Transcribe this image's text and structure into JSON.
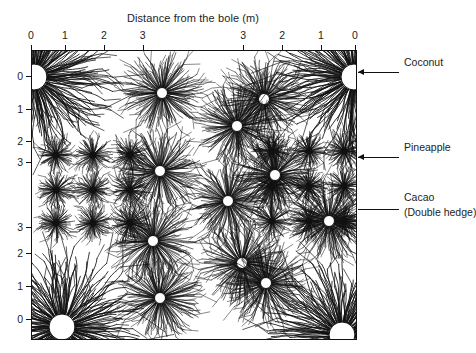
{
  "figure": {
    "axis_title": "Distance from the bole (m)",
    "background_color": "#ffffff",
    "ink_color": "#111111",
    "bole_color": "#ffffff"
  },
  "axes": {
    "x": {
      "label": "Distance from the bole (m)",
      "ticks": [
        {
          "label": "0",
          "pos": 0.0
        },
        {
          "label": "1",
          "pos": 0.105
        },
        {
          "label": "2",
          "pos": 0.225
        },
        {
          "label": "3",
          "pos": 0.345
        },
        {
          "label": "3",
          "pos": 0.655
        },
        {
          "label": "2",
          "pos": 0.775
        },
        {
          "label": "1",
          "pos": 0.895
        },
        {
          "label": "0",
          "pos": 1.0
        }
      ]
    },
    "y": {
      "label": "Distance from the bole (m)",
      "ticks": [
        {
          "label": "0",
          "pos": 0.09
        },
        {
          "label": "1",
          "pos": 0.205
        },
        {
          "label": "2",
          "pos": 0.315
        },
        {
          "label": "3",
          "pos": 0.39
        },
        {
          "label": "3",
          "pos": 0.615
        },
        {
          "label": "2",
          "pos": 0.705
        },
        {
          "label": "1",
          "pos": 0.82
        },
        {
          "label": "0",
          "pos": 0.935
        }
      ]
    }
  },
  "annotations": [
    {
      "id": "coconut",
      "label": "Coconut",
      "sublabel": "",
      "arrow": true,
      "y": 72
    },
    {
      "id": "pineapple",
      "label": "Pineapple",
      "sublabel": "",
      "arrow": true,
      "y": 157
    },
    {
      "id": "cacao",
      "label": "Cacao",
      "sublabel": "(Double hedge)",
      "arrow": false,
      "y": 209
    }
  ],
  "chart_data": {
    "type": "scatter",
    "xlabel": "Distance from the bole (m)",
    "ylabel": "Distance from the bole (m)",
    "xlim": [
      0,
      324
    ],
    "ylim": [
      0,
      288
    ],
    "grid": false,
    "legend": [
      "Coconut",
      "Pineapple",
      "Cacao (Double hedge)"
    ],
    "species": [
      {
        "name": "Coconut",
        "bole_radius": 13,
        "root_radius": 66,
        "root_count": 260,
        "bole_visible": true,
        "plants": [
          {
            "x": 2,
            "y": 26
          },
          {
            "x": 322,
            "y": 26
          },
          {
            "x": 30,
            "y": 276
          },
          {
            "x": 310,
            "y": 284
          }
        ]
      },
      {
        "name": "Cacao",
        "bole_radius": 5.5,
        "root_radius": 36,
        "root_count": 170,
        "bole_visible": true,
        "plants": [
          {
            "x": 130,
            "y": 42
          },
          {
            "x": 232,
            "y": 48
          },
          {
            "x": 205,
            "y": 75
          },
          {
            "x": 128,
            "y": 120
          },
          {
            "x": 243,
            "y": 124
          },
          {
            "x": 196,
            "y": 150
          },
          {
            "x": 121,
            "y": 190
          },
          {
            "x": 210,
            "y": 212
          },
          {
            "x": 128,
            "y": 247
          },
          {
            "x": 234,
            "y": 232
          },
          {
            "x": 297,
            "y": 170
          }
        ]
      },
      {
        "name": "Pineapple",
        "bole_radius": 0,
        "root_radius": 18,
        "root_count": 95,
        "bole_visible": false,
        "plants": [
          {
            "x": 24,
            "y": 104
          },
          {
            "x": 61,
            "y": 104
          },
          {
            "x": 98,
            "y": 104
          },
          {
            "x": 24,
            "y": 139
          },
          {
            "x": 61,
            "y": 139
          },
          {
            "x": 98,
            "y": 139
          },
          {
            "x": 24,
            "y": 172
          },
          {
            "x": 61,
            "y": 172
          },
          {
            "x": 98,
            "y": 172
          },
          {
            "x": 240,
            "y": 100
          },
          {
            "x": 277,
            "y": 100
          },
          {
            "x": 312,
            "y": 100
          },
          {
            "x": 240,
            "y": 135
          },
          {
            "x": 277,
            "y": 135
          },
          {
            "x": 312,
            "y": 135
          },
          {
            "x": 240,
            "y": 170
          },
          {
            "x": 277,
            "y": 170
          },
          {
            "x": 312,
            "y": 170
          }
        ]
      }
    ]
  }
}
